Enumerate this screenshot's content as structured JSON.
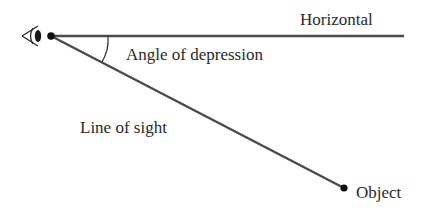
{
  "diagram": {
    "type": "trigonometry-angle-of-depression",
    "labels": {
      "horizontal": "Horizontal",
      "angle": "Angle of depression",
      "line_of_sight": "Line of sight",
      "object": "Object"
    },
    "icons": {
      "observer": "eye-icon"
    },
    "colors": {
      "line": "#4a4a4a",
      "text": "#2a2a2a",
      "background": "#ffffff"
    }
  }
}
